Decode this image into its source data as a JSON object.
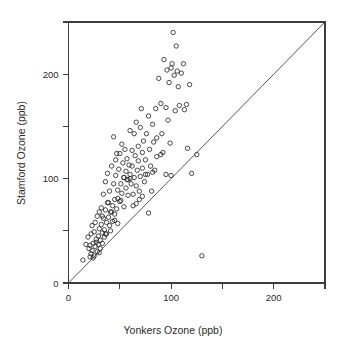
{
  "chart_data": {
    "type": "scatter",
    "title": "",
    "xlabel": "Yonkers Ozone (ppb)",
    "ylabel": "Stamford Ozone (ppb)",
    "xlim": [
      0,
      250
    ],
    "ylim": [
      0,
      250
    ],
    "grid": false,
    "legend": null,
    "x_ticks_major": [
      0,
      100,
      200
    ],
    "x_tick_labels": [
      "0",
      "100",
      "200"
    ],
    "x_ticks_minor": [
      50,
      150,
      250
    ],
    "y_ticks_major": [
      0,
      100,
      200
    ],
    "y_tick_labels": [
      "0",
      "100",
      "200"
    ],
    "y_ticks_minor": [
      50,
      150,
      250
    ],
    "marker": "open-circle",
    "marker_size_px": 4.4,
    "point_color": "#2b2b2b",
    "reference_line": {
      "name": "identity-line",
      "from": [
        0,
        0
      ],
      "to": [
        250,
        250
      ],
      "color": "#444444"
    },
    "x": [
      14,
      17,
      19,
      20,
      21,
      22,
      22,
      23,
      23,
      24,
      25,
      25,
      26,
      26,
      27,
      28,
      28,
      29,
      29,
      30,
      30,
      31,
      31,
      32,
      32,
      33,
      33,
      34,
      34,
      35,
      35,
      36,
      36,
      37,
      37,
      38,
      38,
      39,
      40,
      40,
      41,
      41,
      42,
      43,
      43,
      44,
      44,
      45,
      45,
      46,
      46,
      47,
      47,
      48,
      48,
      49,
      50,
      50,
      51,
      52,
      52,
      53,
      54,
      54,
      55,
      56,
      56,
      57,
      58,
      58,
      59,
      60,
      60,
      61,
      62,
      62,
      63,
      64,
      64,
      65,
      66,
      66,
      67,
      68,
      68,
      69,
      70,
      70,
      71,
      72,
      72,
      73,
      74,
      75,
      76,
      77,
      78,
      79,
      80,
      81,
      82,
      83,
      84,
      85,
      86,
      88,
      90,
      91,
      92,
      93,
      95,
      96,
      97,
      98,
      99,
      100,
      101,
      102,
      103,
      104,
      105,
      106,
      107,
      108,
      110,
      112,
      113,
      115,
      116,
      118,
      120,
      125,
      130,
      21,
      24,
      27,
      30,
      33,
      36,
      39,
      42,
      45,
      48,
      51,
      54,
      57,
      60,
      63,
      66,
      69,
      72,
      75,
      78,
      82,
      86,
      90,
      95,
      100,
      106
    ],
    "y": [
      22,
      37,
      44,
      33,
      36,
      28,
      47,
      31,
      55,
      38,
      26,
      49,
      35,
      58,
      42,
      30,
      64,
      45,
      37,
      52,
      68,
      41,
      33,
      56,
      72,
      48,
      38,
      62,
      85,
      51,
      44,
      70,
      97,
      58,
      47,
      77,
      105,
      63,
      55,
      88,
      68,
      50,
      112,
      74,
      59,
      95,
      140,
      80,
      66,
      118,
      103,
      71,
      124,
      89,
      57,
      109,
      124,
      78,
      95,
      133,
      86,
      115,
      101,
      73,
      128,
      107,
      91,
      119,
      99,
      84,
      113,
      146,
      104,
      95,
      127,
      112,
      85,
      143,
      101,
      122,
      154,
      93,
      108,
      131,
      117,
      88,
      149,
      102,
      167,
      125,
      110,
      136,
      97,
      118,
      143,
      104,
      160,
      128,
      112,
      88,
      152,
      135,
      108,
      167,
      121,
      196,
      172,
      143,
      125,
      214,
      168,
      204,
      156,
      192,
      134,
      206,
      210,
      240,
      199,
      165,
      227,
      203,
      188,
      170,
      201,
      210,
      166,
      171,
      129,
      190,
      105,
      123,
      26,
      25,
      24,
      39,
      29,
      64,
      47,
      77,
      68,
      60,
      81,
      79,
      101,
      99,
      100,
      74,
      76,
      80,
      83,
      104,
      67,
      106,
      139,
      123,
      104,
      103
    ],
    "n_points": 159
  },
  "axis": {
    "x_title": "Yonkers Ozone (ppb)",
    "y_title": "Stamford Ozone (ppb)"
  }
}
